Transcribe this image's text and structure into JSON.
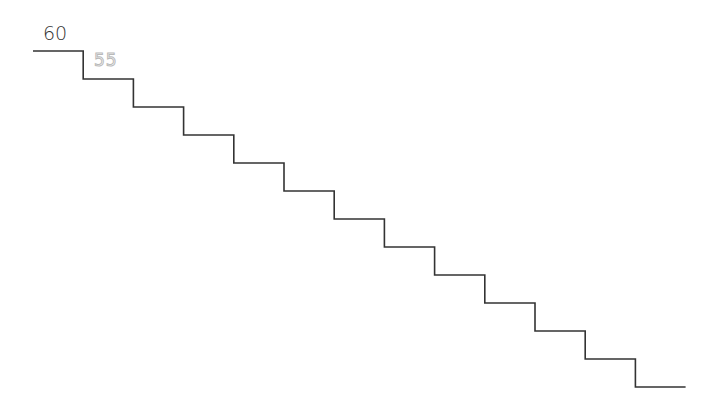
{
  "labels": {
    "current_value": "60",
    "next_value": "55"
  },
  "staircase": {
    "start_x": 33,
    "start_y": 51,
    "step_width": 50.2,
    "step_height": 28,
    "steps": 13,
    "stroke_color": "#333333"
  },
  "colors": {
    "background": "#ffffff",
    "line": "#333333",
    "dotted_text": "#b9b9b9"
  }
}
